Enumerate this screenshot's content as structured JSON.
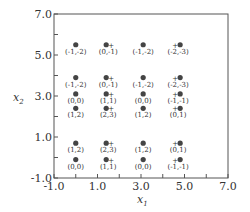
{
  "chart_data": {
    "type": "scatter",
    "title": "",
    "xlabel": "x",
    "xlabel_sub": "1",
    "ylabel": "x",
    "ylabel_sub": "2",
    "xlim": [
      -1.0,
      7.0
    ],
    "ylim": [
      -1.0,
      7.0
    ],
    "x_ticks": [
      -1.0,
      0.0,
      1.0,
      2.0,
      3.0,
      4.0,
      5.0,
      6.0,
      7.0
    ],
    "y_ticks": [
      -1.0,
      0.0,
      1.0,
      2.0,
      3.0,
      4.0,
      5.0,
      6.0,
      7.0
    ],
    "x_tick_labels": [
      {
        "value": -1.0,
        "label": "-1.0"
      },
      {
        "value": 1.0,
        "label": "1.0"
      },
      {
        "value": 3.0,
        "label": "3.0"
      },
      {
        "value": 5.0,
        "label": "5.0"
      },
      {
        "value": 7.0,
        "label": "7.0"
      }
    ],
    "y_tick_labels": [
      {
        "value": -1.0,
        "label": "-1.0"
      },
      {
        "value": 1.0,
        "label": "1.0"
      },
      {
        "value": 3.0,
        "label": "3.0"
      },
      {
        "value": 5.0,
        "label": "5.0"
      },
      {
        "value": 7.0,
        "label": "7.0"
      }
    ],
    "grid": false,
    "points": [
      {
        "x": 0.0,
        "y": 5.5,
        "label": "(-1,-2)",
        "plus": "none"
      },
      {
        "x": 1.4,
        "y": 5.5,
        "label": "(0,-1)",
        "plus": "right"
      },
      {
        "x": 3.1,
        "y": 5.5,
        "label": "(-1,-2)",
        "plus": "none"
      },
      {
        "x": 4.8,
        "y": 5.5,
        "label": "(-2,-3)",
        "plus": "left"
      },
      {
        "x": 0.0,
        "y": 3.9,
        "label": "(-1,-2)",
        "plus": "none"
      },
      {
        "x": 1.4,
        "y": 3.9,
        "label": "(0,-1)",
        "plus": "right"
      },
      {
        "x": 3.1,
        "y": 3.9,
        "label": "(-1,-2)",
        "plus": "none"
      },
      {
        "x": 4.8,
        "y": 3.9,
        "label": "(-2,-3)",
        "plus": "left"
      },
      {
        "x": 0.0,
        "y": 3.1,
        "label": "(0,0)",
        "plus": "none"
      },
      {
        "x": 1.4,
        "y": 3.1,
        "label": "(1,1)",
        "plus": "right"
      },
      {
        "x": 3.1,
        "y": 3.1,
        "label": "(0,0)",
        "plus": "none"
      },
      {
        "x": 4.8,
        "y": 3.1,
        "label": "(-1,-1)",
        "plus": "left"
      },
      {
        "x": 0.0,
        "y": 2.4,
        "label": "(1,2)",
        "plus": "none"
      },
      {
        "x": 1.4,
        "y": 2.4,
        "label": "(2,3)",
        "plus": "right"
      },
      {
        "x": 3.1,
        "y": 2.4,
        "label": "(1,2)",
        "plus": "none"
      },
      {
        "x": 4.8,
        "y": 2.4,
        "label": "(0,1)",
        "plus": "left"
      },
      {
        "x": 0.0,
        "y": 0.7,
        "label": "(1,2)",
        "plus": "none"
      },
      {
        "x": 1.4,
        "y": 0.7,
        "label": "(2,3)",
        "plus": "right"
      },
      {
        "x": 3.1,
        "y": 0.7,
        "label": "(1,2)",
        "plus": "none"
      },
      {
        "x": 4.8,
        "y": 0.7,
        "label": "(0,1)",
        "plus": "left"
      },
      {
        "x": 0.0,
        "y": -0.1,
        "label": "(0,0)",
        "plus": "none"
      },
      {
        "x": 1.4,
        "y": -0.1,
        "label": "(1,1)",
        "plus": "right"
      },
      {
        "x": 3.1,
        "y": -0.1,
        "label": "(0,0)",
        "plus": "none"
      },
      {
        "x": 4.8,
        "y": -0.1,
        "label": "(-1,-1)",
        "plus": "left"
      }
    ],
    "colors": {
      "axis": "#555555",
      "point": "#444444",
      "text": "#333333"
    }
  }
}
